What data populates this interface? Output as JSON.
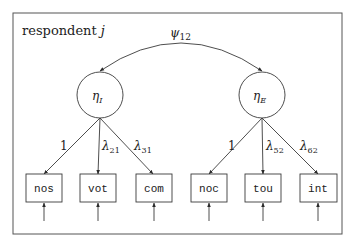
{
  "diagram": {
    "type": "structural-equation-model",
    "frame_label": {
      "text": "respondent ",
      "var": "j"
    },
    "covariance": {
      "symbol": "ψ",
      "sub": "12"
    },
    "latents": [
      {
        "symbol": "η",
        "sub": "I"
      },
      {
        "symbol": "η",
        "sub": "E"
      }
    ],
    "loadings": [
      {
        "text": "1",
        "sub": ""
      },
      {
        "text": "λ",
        "sub": "21"
      },
      {
        "text": "λ",
        "sub": "31"
      },
      {
        "text": "1",
        "sub": ""
      },
      {
        "text": "λ",
        "sub": "52"
      },
      {
        "text": "λ",
        "sub": "62"
      }
    ],
    "indicators": [
      {
        "label": "nos",
        "latent": 0
      },
      {
        "label": "vot",
        "latent": 0
      },
      {
        "label": "com",
        "latent": 0
      },
      {
        "label": "noc",
        "latent": 1
      },
      {
        "label": "tou",
        "latent": 1
      },
      {
        "label": "int",
        "latent": 1
      }
    ],
    "colors": {
      "stroke": "#3a3a3a",
      "frame": "#555555",
      "background": "#ffffff"
    }
  }
}
